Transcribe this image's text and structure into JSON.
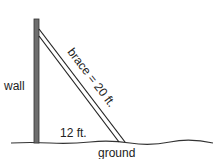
{
  "diagram": {
    "labels": {
      "wall": "wall",
      "brace": "brace = 20 ft.",
      "base": "12 ft.",
      "ground": "ground"
    },
    "colors": {
      "wall_fill": "#6e6e6e",
      "stroke": "#222222",
      "background": "#ffffff"
    }
  }
}
